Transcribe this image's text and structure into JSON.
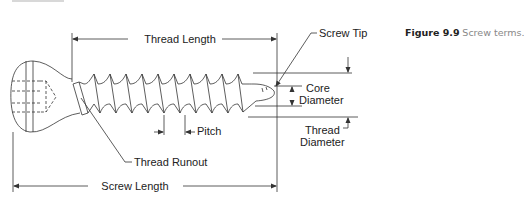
{
  "figure": {
    "number": "Figure 9.9",
    "caption": "Screw terms."
  },
  "labels": {
    "thread_length": "Thread Length",
    "screw_tip": "Screw Tip",
    "core_diameter_1": "Core",
    "core_diameter_2": "Diameter",
    "pitch": "Pitch",
    "thread_diameter_1": "Thread",
    "thread_diameter_2": "Diameter",
    "thread_runout": "Thread Runout",
    "screw_length": "Screw Length"
  },
  "colors": {
    "line": "#333333",
    "caption_number": "#222222",
    "caption_text": "#888888"
  }
}
